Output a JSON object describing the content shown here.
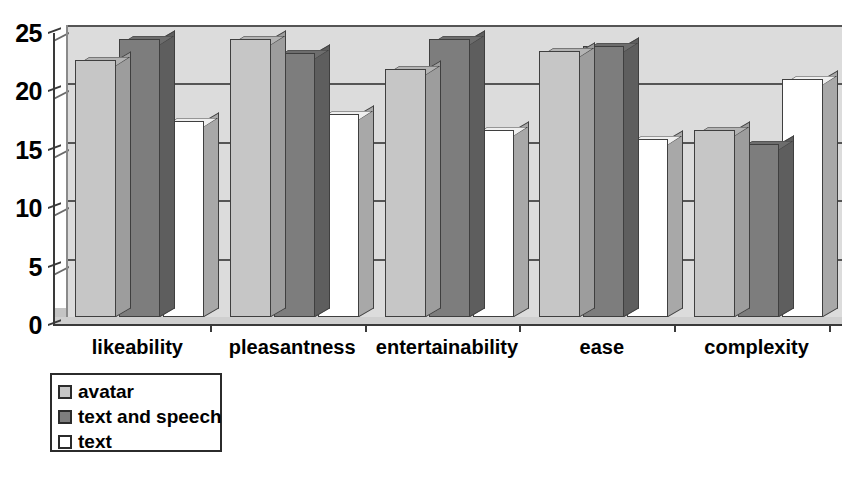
{
  "chart_data": {
    "type": "bar",
    "title": "",
    "subtitle": "",
    "xlabel": "",
    "ylabel": "",
    "ylim": [
      0,
      25
    ],
    "yticks": [
      0,
      5,
      10,
      15,
      20,
      25
    ],
    "grid": true,
    "legend_position": "bottom-left",
    "style": "3d-clustered-column",
    "categories": [
      "likeability",
      "pleasantness",
      "entertainability",
      "ease",
      "complexity"
    ],
    "series": [
      {
        "name": "avatar",
        "color": "#c6c6c6",
        "values": [
          22.0,
          23.8,
          21.2,
          22.8,
          16.0
        ]
      },
      {
        "name": "text and speech",
        "color": "#7d7d7d",
        "values": [
          23.8,
          22.6,
          23.8,
          23.2,
          14.8
        ]
      },
      {
        "name": "text",
        "color": "#ffffff",
        "values": [
          16.8,
          17.4,
          16.0,
          15.2,
          20.4
        ]
      }
    ]
  },
  "axis": {
    "y_tick_labels": [
      "0",
      "5",
      "10",
      "15",
      "20",
      "25"
    ]
  },
  "legend": {
    "items": [
      {
        "label": "avatar",
        "swatch": "#c6c6c6"
      },
      {
        "label": "text and speech",
        "swatch": "#7d7d7d"
      },
      {
        "label": "text",
        "swatch": "#ffffff"
      }
    ]
  },
  "colors": {
    "plot_background": "#dcdcdc",
    "gridline": "#555555",
    "axis": "#3a3a3a",
    "floor": "#cfcfcf"
  }
}
